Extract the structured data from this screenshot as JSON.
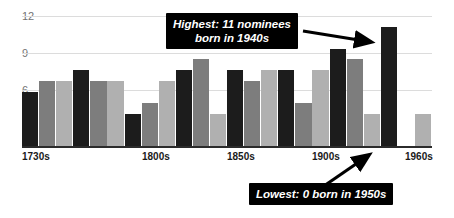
{
  "chart_data": {
    "type": "bar",
    "title": "",
    "xlabel": "",
    "ylabel": "",
    "ylim": [
      0,
      12
    ],
    "grid": true,
    "legend": "none",
    "y_ticks": [
      12,
      9,
      6
    ],
    "x_tick_labels": [
      "1730s",
      "1800s",
      "1850s",
      "1900s",
      "1960s"
    ],
    "x_tick_indices": [
      0,
      7,
      12,
      17,
      23
    ],
    "categories": [
      "1730s",
      "1740s",
      "1750s",
      "1760s",
      "1770s",
      "1780s",
      "1790s",
      "1800s",
      "1810s",
      "1820s",
      "1830s",
      "1840s",
      "1850s",
      "1860s",
      "1870s",
      "1880s",
      "1890s",
      "1900s",
      "1910s",
      "1920s",
      "1930s",
      "1940s",
      "1950s",
      "1960s"
    ],
    "values": [
      5,
      6,
      6,
      7,
      6,
      6,
      3,
      4,
      6,
      7,
      8,
      3,
      7,
      6,
      7,
      7,
      4,
      7,
      9,
      8,
      3,
      11,
      0,
      3
    ],
    "bar_colors": [
      "#1c1c1c",
      "#7d7d7d",
      "#b0b0b0"
    ],
    "annotations": [
      {
        "text": "Highest: 11 nominees\nborn in 1940s",
        "target_category": "1940s",
        "target_value": 11
      },
      {
        "text": "Lowest: 0 born in 1950s",
        "target_category": "1950s",
        "target_value": 0
      }
    ]
  },
  "axis": {
    "y_tick_0": "12",
    "y_tick_1": "9",
    "y_tick_2": "6"
  },
  "xaxis": {
    "label_0": "1730s",
    "label_1": "1800s",
    "label_2": "1850s",
    "label_3": "1900s",
    "label_4": "1960s"
  },
  "callouts": {
    "highest": "Highest: 11 nominees\nborn in 1940s",
    "lowest": "Lowest: 0 born in 1950s"
  }
}
